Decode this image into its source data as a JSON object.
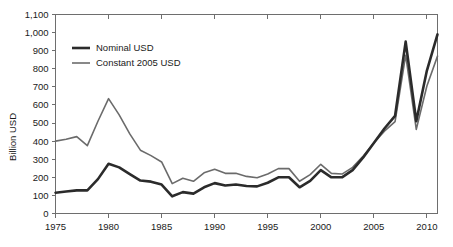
{
  "chart_data": {
    "type": "line",
    "title": "",
    "xlabel": "",
    "ylabel": "Billion USD",
    "xlim": [
      1975,
      2011
    ],
    "ylim": [
      0,
      1100
    ],
    "grid": false,
    "legend_position": "top-left",
    "xticks": [
      "1975",
      "1980",
      "1985",
      "1990",
      "1995",
      "2000",
      "2005",
      "2010"
    ],
    "xtick_values": [
      1975,
      1980,
      1985,
      1990,
      1995,
      2000,
      2005,
      2010
    ],
    "yticks": [
      "0",
      "100",
      "200",
      "300",
      "400",
      "500",
      "600",
      "700",
      "800",
      "900",
      "1,000",
      "1,100"
    ],
    "ytick_values": [
      0,
      100,
      200,
      300,
      400,
      500,
      600,
      700,
      800,
      900,
      1000,
      1100
    ],
    "x": [
      1975,
      1976,
      1977,
      1978,
      1979,
      1980,
      1981,
      1982,
      1983,
      1984,
      1985,
      1986,
      1987,
      1988,
      1989,
      1990,
      1991,
      1992,
      1993,
      1994,
      1995,
      1996,
      1997,
      1998,
      1999,
      2000,
      2001,
      2002,
      2003,
      2004,
      2005,
      2006,
      2007,
      2008,
      2009,
      2010,
      2011
    ],
    "series": [
      {
        "name": "Nominal USD",
        "color": "#2b2b2b",
        "linewidth": 2.6,
        "values": [
          115,
          122,
          128,
          128,
          190,
          275,
          255,
          218,
          182,
          176,
          160,
          95,
          118,
          110,
          145,
          168,
          155,
          160,
          152,
          150,
          170,
          200,
          200,
          145,
          180,
          240,
          200,
          200,
          240,
          310,
          390,
          470,
          540,
          950,
          510,
          790,
          990
        ]
      },
      {
        "name": "Constant 2005 USD",
        "color": "#6b6b6b",
        "linewidth": 1.6,
        "values": [
          400,
          410,
          425,
          375,
          510,
          635,
          545,
          440,
          350,
          320,
          285,
          165,
          195,
          178,
          225,
          245,
          222,
          222,
          205,
          198,
          218,
          248,
          248,
          178,
          215,
          272,
          222,
          218,
          255,
          318,
          390,
          455,
          508,
          875,
          465,
          705,
          870
        ]
      }
    ]
  },
  "legend": {
    "items": [
      {
        "label": "Nominal USD"
      },
      {
        "label": "Constant 2005 USD"
      }
    ]
  },
  "colors": {
    "nominal": "#2b2b2b",
    "constant": "#6b6b6b",
    "axis": "#6e6e6e",
    "text": "#1a1a1a",
    "background": "#ffffff"
  }
}
